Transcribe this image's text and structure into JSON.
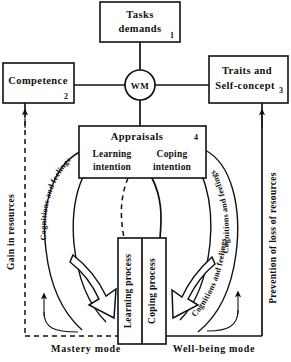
{
  "boxes": {
    "tasks": {
      "line1": "Tasks",
      "line2": "demands",
      "number": "1"
    },
    "competence": {
      "label": "Competence",
      "number": "2"
    },
    "traits": {
      "line1": "Traits and",
      "line2": "Self-concept",
      "number": "3"
    },
    "appraisals": {
      "label": "Appraisals",
      "number": "4"
    }
  },
  "hub": {
    "label": "WM"
  },
  "intentions": {
    "learning": {
      "line1": "Learning",
      "line2": "intention"
    },
    "coping": {
      "line1": "Coping",
      "line2": "intention"
    }
  },
  "processes": {
    "learning": "Learning process",
    "coping": "Coping process"
  },
  "rails": {
    "left": "Gain in resources",
    "right": "Prevention of loss of resources"
  },
  "modes": {
    "left": "Mastery mode",
    "right": "Well-being mode"
  },
  "arcs": {
    "outer_left": "Cognitions and feelings",
    "inner_right": "Cognitions and feelings",
    "outer_right": "Cognitions and feelings"
  },
  "colors": {
    "ink": "#111111",
    "paper": "#ffffff"
  }
}
